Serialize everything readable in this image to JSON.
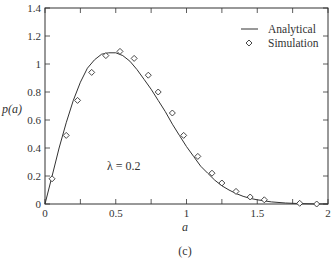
{
  "chart_data": {
    "type": "line",
    "title": "",
    "caption": "(c)",
    "xlabel": "a",
    "ylabel": "p(a)",
    "xlim": [
      0,
      2
    ],
    "ylim": [
      0,
      1.4
    ],
    "xticks": [
      0,
      0.5,
      1,
      1.5,
      2
    ],
    "xtick_labels": [
      "0",
      "0.5",
      "1",
      "1.5",
      "2"
    ],
    "yticks": [
      0,
      0.2,
      0.4,
      0.6,
      0.8,
      1,
      1.2,
      1.4
    ],
    "ytick_labels": [
      "0",
      "0.2",
      "0.4",
      "0.6",
      "0.8",
      "1",
      "1.2",
      "1.4"
    ],
    "grid": false,
    "legend_position": "upper right",
    "annotation": "λ = 0.2",
    "series": [
      {
        "name": "Analytical",
        "style": "solid line",
        "x": [
          0,
          0.05,
          0.1,
          0.15,
          0.2,
          0.25,
          0.3,
          0.35,
          0.4,
          0.45,
          0.5,
          0.55,
          0.6,
          0.65,
          0.7,
          0.75,
          0.8,
          0.85,
          0.9,
          0.95,
          1.0,
          1.05,
          1.1,
          1.15,
          1.2,
          1.25,
          1.3,
          1.35,
          1.4,
          1.45,
          1.5,
          1.6,
          1.7,
          1.8,
          1.9,
          2.0
        ],
        "y": [
          0,
          0.2,
          0.4,
          0.58,
          0.74,
          0.87,
          0.97,
          1.03,
          1.07,
          1.08,
          1.08,
          1.06,
          1.02,
          0.96,
          0.89,
          0.82,
          0.74,
          0.66,
          0.57,
          0.49,
          0.41,
          0.34,
          0.27,
          0.22,
          0.17,
          0.13,
          0.1,
          0.075,
          0.055,
          0.04,
          0.03,
          0.015,
          0.007,
          0.003,
          0.001,
          0.0
        ]
      },
      {
        "name": "Simulation",
        "style": "diamond markers",
        "x": [
          0.05,
          0.15,
          0.23,
          0.33,
          0.43,
          0.53,
          0.63,
          0.73,
          0.8,
          0.9,
          0.98,
          1.08,
          1.18,
          1.25,
          1.35,
          1.45,
          1.55,
          1.8,
          1.92
        ],
        "y": [
          0.18,
          0.49,
          0.74,
          0.94,
          1.06,
          1.09,
          1.04,
          0.92,
          0.8,
          0.65,
          0.49,
          0.34,
          0.22,
          0.15,
          0.09,
          0.05,
          0.03,
          0.005,
          0.0
        ]
      }
    ]
  },
  "colors": {
    "line": "#333333",
    "axis": "#333333",
    "background": "#ffffff"
  }
}
